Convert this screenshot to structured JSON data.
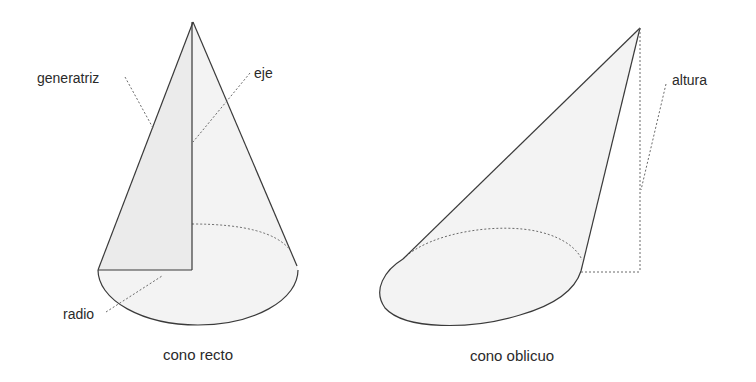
{
  "diagram": {
    "colors": {
      "stroke": "#3a3a3a",
      "fill": "#f3f3f3",
      "shade": "#ebebeb",
      "dotted": "#6a6a6a",
      "text": "#2a2a2a"
    },
    "right_cone": {
      "caption": "cono recto",
      "labels": {
        "generatrix": "generatriz",
        "axis": "eje",
        "radius": "radio"
      }
    },
    "oblique_cone": {
      "caption": "cono oblicuo",
      "labels": {
        "height": "altura"
      }
    }
  }
}
